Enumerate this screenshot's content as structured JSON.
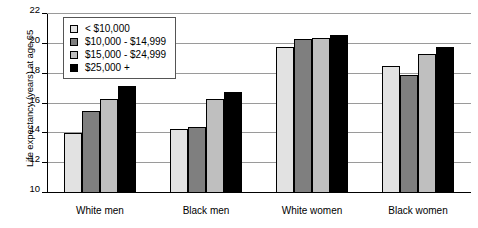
{
  "chart_data": {
    "type": "bar",
    "title": "",
    "xlabel": "",
    "ylabel": "Life expectancy (years) at age 65",
    "ylim": [
      10,
      22
    ],
    "yticks": [
      10,
      12,
      14,
      16,
      18,
      20,
      22
    ],
    "grid": true,
    "legend_position": "top-left inside plot",
    "categories": [
      "White men",
      "Black men",
      "White women",
      "Black women"
    ],
    "series": [
      {
        "name": "< $10,000",
        "color": "#e2e2e2",
        "values": [
          14.0,
          14.3,
          19.8,
          18.5
        ]
      },
      {
        "name": "$10,000 - $14,999",
        "color": "#7f7f7f",
        "values": [
          15.5,
          14.4,
          20.3,
          17.9
        ]
      },
      {
        "name": "$15,000 - $24,999",
        "color": "#bfbfbf",
        "values": [
          16.3,
          16.3,
          20.4,
          19.3
        ]
      },
      {
        "name": "$25,000 +",
        "color": "#000000",
        "values": [
          17.2,
          16.8,
          20.6,
          19.8
        ]
      }
    ]
  }
}
